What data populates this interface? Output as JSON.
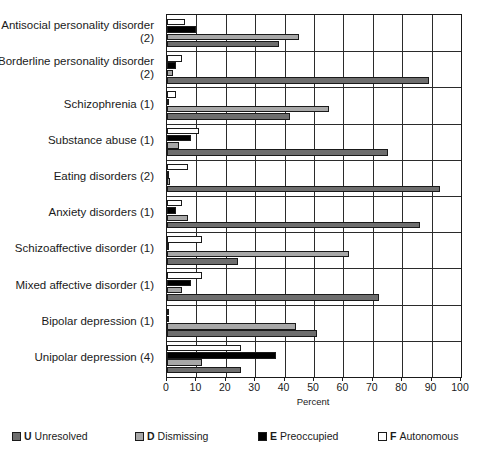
{
  "chart_data": {
    "type": "bar",
    "orientation": "horizontal",
    "title": "",
    "xlabel": "Percent",
    "ylabel": "",
    "xlim": [
      0,
      100
    ],
    "xticks": [
      0,
      10,
      20,
      30,
      40,
      50,
      60,
      70,
      80,
      90,
      100
    ],
    "grid": true,
    "legend_position": "bottom",
    "categories": [
      "Antisocial personality disorder (2)",
      "Borderline personality disorder (2)",
      "Schizophrenia (1)",
      "Substance abuse (1)",
      "Eating disorders (2)",
      "Anxiety disorders (1)",
      "Schizoaffective disorder (1)",
      "Mixed affective disorder (1)",
      "Bipolar depression (1)",
      "Unipolar depression (4)"
    ],
    "series": [
      {
        "key": "F",
        "name": "Autonomous",
        "color": "#ffffff",
        "values": [
          6,
          5,
          3,
          11,
          7,
          5,
          12,
          12,
          0,
          25
        ]
      },
      {
        "key": "E",
        "name": "Preoccupied",
        "color": "#000000",
        "values": [
          10,
          3,
          0,
          8,
          0,
          3,
          0,
          8,
          0,
          37
        ]
      },
      {
        "key": "D",
        "name": "Dismissing",
        "color": "#a8a8a8",
        "values": [
          45,
          2,
          55,
          4,
          1,
          7,
          62,
          5,
          44,
          12
        ]
      },
      {
        "key": "U",
        "name": "Unresolved",
        "color": "#6e6e6e",
        "values": [
          38,
          89,
          42,
          75,
          93,
          86,
          24,
          72,
          51,
          25
        ]
      }
    ]
  },
  "legend": {
    "items": [
      {
        "key": "U",
        "label": "Unresolved",
        "swatch": "u"
      },
      {
        "key": "D",
        "label": "Dismissing",
        "swatch": "d"
      },
      {
        "key": "E",
        "label": "Preoccupied",
        "swatch": "e"
      },
      {
        "key": "F",
        "label": "Autonomous",
        "swatch": "f"
      }
    ]
  }
}
